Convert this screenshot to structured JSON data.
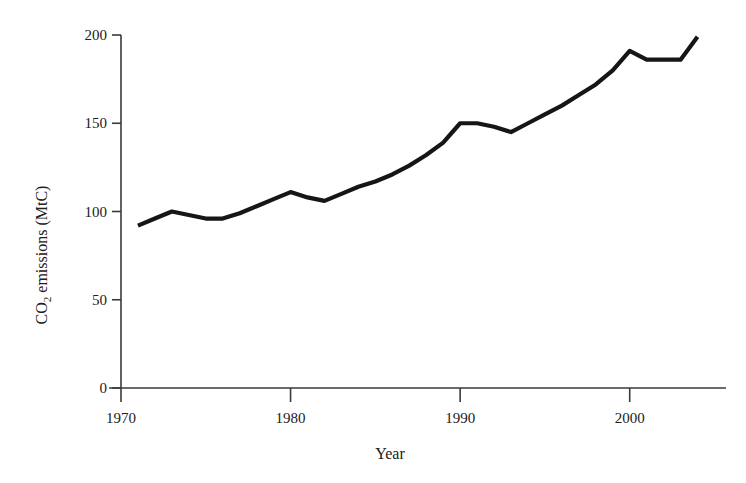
{
  "chart_data": {
    "type": "line",
    "title": "",
    "xlabel": "Year",
    "ylabel": "CO2 emissions (MtC)",
    "ylabel_parts": {
      "pre": "CO",
      "sub": "2",
      "post": " emissions (MtC)"
    },
    "xlim": [
      1970,
      2004.5
    ],
    "ylim": [
      0,
      200
    ],
    "grid": false,
    "legend": null,
    "xticks": [
      1970,
      1980,
      1990,
      2000
    ],
    "xtick_labels": [
      "1970",
      "1980",
      "1990",
      "2000"
    ],
    "yticks": [
      0,
      50,
      100,
      150,
      200
    ],
    "ytick_labels": [
      "0",
      "50",
      "100",
      "150",
      "200"
    ],
    "series": [
      {
        "name": "CO2 emissions",
        "color": "#161616",
        "x": [
          1971,
          1972,
          1973,
          1974,
          1975,
          1976,
          1977,
          1978,
          1979,
          1980,
          1981,
          1982,
          1983,
          1984,
          1985,
          1986,
          1987,
          1988,
          1989,
          1990,
          1991,
          1992,
          1993,
          1994,
          1995,
          1996,
          1997,
          1998,
          1999,
          2000,
          2001,
          2002,
          2003,
          2004
        ],
        "values": [
          92,
          96,
          100,
          98,
          96,
          96,
          99,
          103,
          107,
          111,
          108,
          106,
          110,
          114,
          117,
          121,
          126,
          132,
          139,
          150,
          150,
          148,
          145,
          150,
          155,
          160,
          166,
          172,
          180,
          191,
          186,
          186,
          186,
          199
        ]
      }
    ]
  },
  "figure": {
    "background": "#ffffff",
    "axis_color": "#3a3a3a",
    "line_color": "#161616"
  }
}
